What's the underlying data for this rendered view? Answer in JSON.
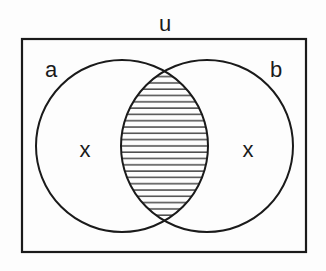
{
  "diagram": {
    "type": "venn",
    "universe_label": "u",
    "sets": [
      {
        "label": "a",
        "region_mark": "x"
      },
      {
        "label": "b",
        "region_mark": "x"
      }
    ],
    "shaded_region": "a ∩ b",
    "shading": "horizontal-lines",
    "colors": {
      "stroke": "#1a1a1a",
      "background": "#fdfdfd"
    }
  }
}
